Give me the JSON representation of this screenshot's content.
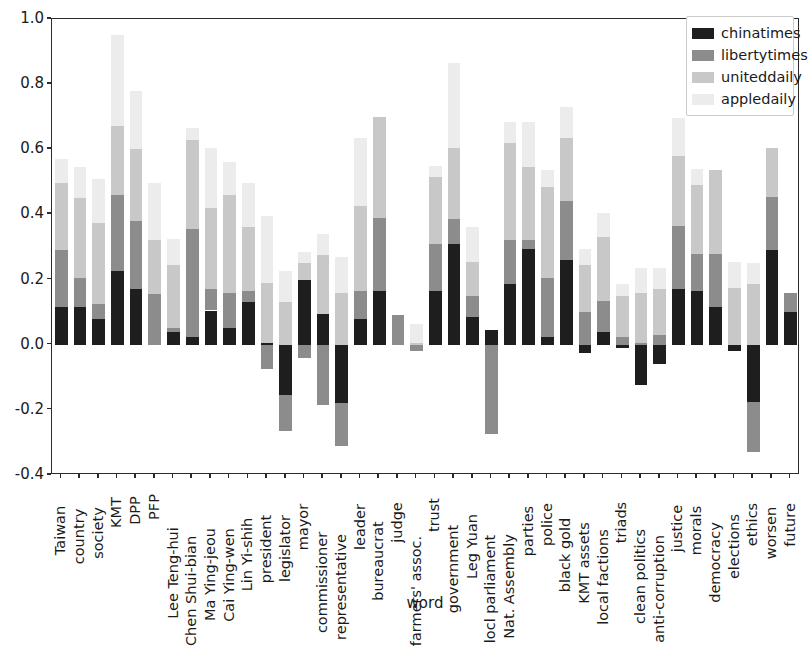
{
  "chart_data": {
    "type": "bar",
    "subtype": "stacked",
    "title": "",
    "xlabel": "word",
    "ylabel": "",
    "ylim": [
      -0.4,
      1.0
    ],
    "yticks": [
      "1.0",
      "0.8",
      "0.6",
      "0.4",
      "0.2",
      "0.0",
      "-0.2",
      "-0.4"
    ],
    "ytick_values": [
      1.0,
      0.8,
      0.6,
      0.4,
      0.2,
      0.0,
      -0.2,
      -0.4
    ],
    "grid": false,
    "legend_position": "upper right",
    "colors": {
      "chinatimes": "#1e1e1e",
      "libertytimes": "#8c8c8c",
      "uniteddaily": "#c8c8c8",
      "appledaily": "#ececed"
    },
    "categories": [
      "Taiwan",
      "country",
      "society",
      "KMT",
      "DPP",
      "PFP",
      "Lee Teng-hui",
      "Chen Shui-bian",
      "Ma Ying-jeou",
      "Cai Ying-wen",
      "Lin Yi-shih",
      "president",
      "legislator",
      "mayor",
      "commissioner",
      "representative",
      "leader",
      "bureaucrat",
      "judge",
      "farmers' assoc.",
      "trust",
      "government",
      "Leg Yuan",
      "locl parliament",
      "Nat. Assembly",
      "parties",
      "police",
      "black gold",
      "KMT assets",
      "local factions",
      "triads",
      "clean politics",
      "anti-corruption",
      "justice",
      "morals",
      "democracy",
      "elections",
      "ethics",
      "worsen",
      "future"
    ],
    "series": [
      {
        "name": "chinatimes",
        "values": [
          0.115,
          0.115,
          0.08,
          0.225,
          0.17,
          0.0,
          0.04,
          0.025,
          0.105,
          0.05,
          0.13,
          0.005,
          -0.155,
          0.2,
          0.095,
          -0.18,
          0.08,
          0.165,
          0.0,
          0.0,
          0.165,
          0.31,
          0.085,
          0.045,
          0.185,
          0.295,
          0.025,
          0.26,
          -0.025,
          0.04,
          -0.01,
          -0.125,
          -0.06,
          0.17,
          0.165,
          0.115,
          -0.02,
          -0.175,
          0.29,
          0.1
        ]
      },
      {
        "name": "libertytimes",
        "values": [
          0.175,
          0.09,
          0.045,
          0.235,
          0.21,
          0.155,
          0.01,
          0.33,
          0.065,
          0.11,
          0.035,
          -0.075,
          -0.11,
          -0.04,
          -0.185,
          -0.13,
          0.085,
          0.225,
          0.09,
          -0.02,
          0.145,
          0.075,
          0.065,
          -0.275,
          0.135,
          0.025,
          0.18,
          0.18,
          0.1,
          0.095,
          0.025,
          0.005,
          0.03,
          0.195,
          0.115,
          0.165,
          0.0,
          -0.155,
          0.165,
          0.06
        ]
      },
      {
        "name": "uniteddaily",
        "values": [
          0.205,
          0.245,
          0.25,
          0.21,
          0.22,
          0.165,
          0.195,
          0.275,
          0.25,
          0.3,
          0.195,
          0.185,
          0.13,
          0.05,
          0.18,
          0.16,
          0.26,
          0.31,
          0.0,
          0.005,
          0.205,
          0.22,
          0.105,
          0.0,
          0.3,
          0.225,
          0.28,
          0.195,
          0.145,
          0.195,
          0.125,
          0.155,
          0.14,
          0.215,
          0.21,
          0.255,
          0.175,
          0.185,
          0.15,
          0.0
        ]
      },
      {
        "name": "appledaily",
        "values": [
          0.075,
          0.095,
          0.135,
          0.28,
          0.18,
          0.175,
          0.08,
          0.035,
          0.185,
          0.1,
          0.135,
          0.205,
          0.095,
          0.035,
          0.065,
          0.11,
          0.21,
          0.0,
          0.0,
          0.06,
          0.035,
          0.26,
          0.105,
          0.0,
          0.065,
          0.14,
          0.05,
          0.095,
          0.05,
          0.075,
          0.035,
          0.075,
          0.065,
          0.115,
          0.05,
          0.0,
          0.08,
          0.065,
          0.0,
          0.0
        ]
      }
    ]
  },
  "legend": {
    "entries": [
      {
        "label": "chinatimes"
      },
      {
        "label": "libertytimes"
      },
      {
        "label": "uniteddaily"
      },
      {
        "label": "appledaily"
      }
    ]
  },
  "axes": {
    "x_title": "word"
  }
}
